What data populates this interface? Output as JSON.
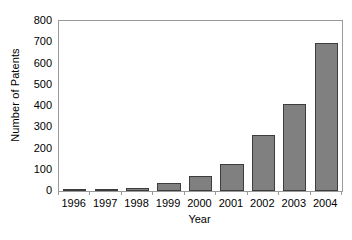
{
  "chart_data": {
    "type": "bar",
    "title": "",
    "xlabel": "Year",
    "ylabel": "Number of Patents",
    "categories": [
      "1996",
      "1997",
      "1998",
      "1999",
      "2000",
      "2001",
      "2002",
      "2003",
      "2004"
    ],
    "values": [
      8,
      8,
      15,
      38,
      72,
      128,
      265,
      408,
      698
    ],
    "ylim": [
      0,
      800
    ],
    "yticks": [
      0,
      100,
      200,
      300,
      400,
      500,
      600,
      700,
      800
    ],
    "ytick_labels": [
      "0",
      "100",
      "200",
      "300",
      "400",
      "500",
      "600",
      "700",
      "800"
    ],
    "grid": false,
    "legend": false,
    "legend_position": "none",
    "bar_color": "#808080",
    "bar_edge_color": "#3d3d3d",
    "axis_color": "#9a9a9a",
    "background_color": "#ffffff"
  }
}
